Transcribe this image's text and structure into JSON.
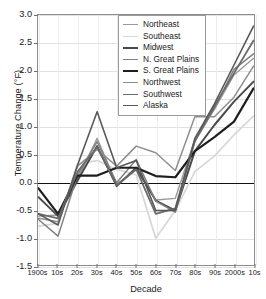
{
  "chart_data": {
    "type": "line",
    "title": "",
    "xlabel": "Decade",
    "ylabel": "Temperature Change (°F)",
    "categories": [
      "1900s",
      "10s",
      "20s",
      "30s",
      "40s",
      "50s",
      "60s",
      "70s",
      "80s",
      "90s",
      "2000s",
      "10s"
    ],
    "xlim": [
      0,
      11
    ],
    "ylim": [
      -1.5,
      3.0
    ],
    "yticks": [
      3.0,
      2.5,
      2.0,
      1.5,
      1.0,
      0.5,
      0.0,
      -0.5,
      -1.0,
      -1.5
    ],
    "ytick_labels": [
      "3.0",
      "2.5",
      "2.0",
      "1.5",
      "1.0",
      "0.5",
      "0.0",
      "-0.5",
      "-1.0",
      "-1.5"
    ],
    "grid": true,
    "zero_line": 0.0,
    "legend_position": "top-center",
    "series": [
      {
        "name": "Northeast",
        "color": "#9a9a9a",
        "width": 1.4,
        "values": [
          -0.62,
          -0.6,
          0.05,
          0.78,
          -0.05,
          0.22,
          -0.33,
          -0.3,
          0.76,
          1.3,
          1.92,
          2.22
        ]
      },
      {
        "name": "Southeast",
        "color": "#d8d8d8",
        "width": 1.8,
        "values": [
          -0.8,
          -0.75,
          0.32,
          0.38,
          0.22,
          0.12,
          -1.02,
          -0.52,
          0.18,
          0.46,
          0.84,
          1.18
        ]
      },
      {
        "name": "Midwest",
        "color": "#4a4a4a",
        "width": 2.0,
        "values": [
          -0.28,
          -0.62,
          0.02,
          0.64,
          -0.08,
          0.25,
          -0.34,
          -0.52,
          0.55,
          1.02,
          1.44,
          1.8
        ]
      },
      {
        "name": "N. Great Plains",
        "color": "#808080",
        "width": 1.5,
        "values": [
          -0.68,
          -0.98,
          0.12,
          0.72,
          -0.02,
          0.4,
          -0.35,
          -0.55,
          0.72,
          1.32,
          2.02,
          2.3
        ]
      },
      {
        "name": "S. Great Plains",
        "color": "#1e1e1e",
        "width": 2.2,
        "values": [
          -0.12,
          -0.58,
          0.11,
          0.11,
          0.25,
          0.25,
          0.1,
          0.08,
          0.55,
          0.8,
          1.08,
          1.68
        ]
      },
      {
        "name": "Northwest",
        "color": "#8e8e8e",
        "width": 1.5,
        "values": [
          -0.66,
          -0.72,
          0.28,
          0.58,
          0.28,
          0.64,
          0.52,
          0.2,
          1.17,
          1.17,
          1.52,
          2.08
        ]
      },
      {
        "name": "Southwest",
        "color": "#6a6a6a",
        "width": 1.8,
        "values": [
          -0.58,
          -0.66,
          0.18,
          0.62,
          -0.06,
          0.22,
          -0.58,
          -0.48,
          0.74,
          1.36,
          1.95,
          2.54
        ]
      },
      {
        "name": "Alaska",
        "color": "#585858",
        "width": 1.6,
        "values": [
          -0.58,
          -0.78,
          0.3,
          1.26,
          0.25,
          0.38,
          -0.52,
          -0.52,
          0.78,
          1.4,
          2.1,
          2.8
        ]
      }
    ]
  },
  "legend": {
    "items": [
      {
        "label": "Northeast"
      },
      {
        "label": "Southeast"
      },
      {
        "label": "Midwest"
      },
      {
        "label": "N. Great Plains"
      },
      {
        "label": "S. Great Plains"
      },
      {
        "label": "Northwest"
      },
      {
        "label": "Southwest"
      },
      {
        "label": "Alaska"
      }
    ]
  }
}
